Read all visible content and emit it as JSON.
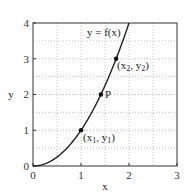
{
  "chart_data": {
    "type": "line",
    "title": "",
    "xlabel": "x",
    "ylabel": "y",
    "xlim": [
      0,
      3
    ],
    "ylim": [
      0,
      4
    ],
    "xticks": [
      0,
      1,
      2,
      3
    ],
    "yticks": [
      0,
      1,
      2,
      3,
      4
    ],
    "xtick_labels": [
      "0",
      "1",
      "2",
      "3"
    ],
    "ytick_labels": [
      "0",
      "1",
      "2",
      "3",
      "4"
    ],
    "grid": true,
    "grid_step": 0.5,
    "legend": "none",
    "series": [
      {
        "name": "y = f(x)",
        "function": "x^2",
        "x": [
          0,
          0.25,
          0.5,
          0.75,
          1.0,
          1.25,
          1.5,
          1.75,
          2.0
        ],
        "y": [
          0,
          0.0625,
          0.25,
          0.5625,
          1.0,
          1.5625,
          2.25,
          3.0625,
          4.0
        ]
      }
    ],
    "annotations": [
      {
        "label": "y = f(x)",
        "x": 1.18,
        "y": 3.6,
        "type": "curve-label"
      },
      {
        "label": "(x1, y1)",
        "x": 1.0,
        "y": 1.0,
        "type": "point"
      },
      {
        "label": "P",
        "x": 1.414,
        "y": 2.0,
        "type": "point"
      },
      {
        "label": "(x2, y2)",
        "x": 1.732,
        "y": 3.0,
        "type": "point"
      }
    ]
  },
  "labels": {
    "xlabel": "x",
    "ylabel": "y",
    "curve": "y = f(x)",
    "p1": "(x",
    "p1_sub1": "1",
    "p1_mid": ", y",
    "p1_sub2": "1",
    "p1_end": ")",
    "pP": "P",
    "p2": "(x",
    "p2_sub1": "2",
    "p2_mid": ", y",
    "p2_sub2": "2",
    "p2_end": ")",
    "xt0": "0",
    "xt1": "1",
    "xt2": "2",
    "xt3": "3",
    "yt0": "0",
    "yt1": "1",
    "yt2": "2",
    "yt3": "3",
    "yt4": "4"
  }
}
